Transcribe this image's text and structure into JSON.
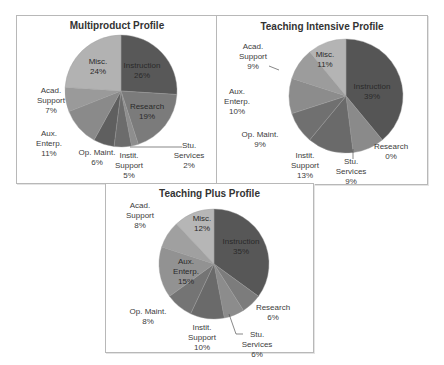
{
  "chart_data": [
    {
      "type": "pie",
      "title": "Multiproduct Profile",
      "frame": {
        "x": 16,
        "y": 15,
        "w": 200,
        "h": 167
      },
      "pie": {
        "cx": 104,
        "cy": 75,
        "r": 56
      },
      "slices": [
        {
          "name": "Instruction",
          "value": 26,
          "color": "#585858",
          "label": [
            "Instruction",
            "26%"
          ],
          "lx": 125,
          "ly": 52,
          "inside": true
        },
        {
          "name": "Research",
          "value": 19,
          "color": "#7b7b7b",
          "label": [
            "Research",
            "19%"
          ],
          "lx": 130,
          "ly": 93,
          "inside": true
        },
        {
          "name": "Stu. Services",
          "value": 2,
          "color": "#8e8e8e",
          "label": [
            "Stu.",
            "Services",
            "2%"
          ],
          "lx": 172,
          "ly": 132,
          "line": [
            [
              113,
              131
            ],
            [
              165,
              131
            ]
          ]
        },
        {
          "name": "Instit. Support",
          "value": 5,
          "color": "#6c6c6c",
          "label": [
            "Instit.",
            "Support",
            "5%"
          ],
          "lx": 112,
          "ly": 142
        },
        {
          "name": "Op. Maint.",
          "value": 6,
          "color": "#5f5f5f",
          "label": [
            "Op. Maint.",
            "6%"
          ],
          "lx": 80,
          "ly": 139
        },
        {
          "name": "Aux. Enterp.",
          "value": 11,
          "color": "#8a8a8a",
          "label": [
            "Aux.",
            "Enterp.",
            "11%"
          ],
          "lx": 32,
          "ly": 120
        },
        {
          "name": "Acad. Support",
          "value": 7,
          "color": "#9a9a9a",
          "label": [
            "Acad.",
            "Support",
            "7%"
          ],
          "lx": 34,
          "ly": 77
        },
        {
          "name": "Misc.",
          "value": 24,
          "color": "#b2b2b2",
          "label": [
            "Misc.",
            "24%"
          ],
          "lx": 81,
          "ly": 48,
          "inside": true
        }
      ]
    },
    {
      "type": "pie",
      "title": "Teaching Intensive Profile",
      "frame": {
        "x": 216,
        "y": 15,
        "w": 210,
        "h": 168
      },
      "pie": {
        "cx": 129,
        "cy": 80,
        "r": 57
      },
      "slices": [
        {
          "name": "Instruction",
          "value": 39,
          "color": "#555555",
          "label": [
            "Instruction",
            "39%"
          ],
          "lx": 155,
          "ly": 73,
          "inside": true
        },
        {
          "name": "Research",
          "value": 0,
          "color": "#7b7b7b",
          "label": [
            "Research",
            "0%"
          ],
          "lx": 174,
          "ly": 133
        },
        {
          "name": "Stu. Services",
          "value": 9,
          "color": "#8a8a8a",
          "label": [
            "Stu.",
            "Services",
            "9%"
          ],
          "lx": 134,
          "ly": 148,
          "line": [
            [
              136,
              133
            ],
            [
              136,
              143
            ]
          ]
        },
        {
          "name": "Instit. Support",
          "value": 13,
          "color": "#6a6a6a",
          "label": [
            "Instit.",
            "Support",
            "13%"
          ],
          "lx": 88,
          "ly": 142
        },
        {
          "name": "Op. Maint.",
          "value": 9,
          "color": "#707070",
          "label": [
            "Op. Maint.",
            "9%"
          ],
          "lx": 43,
          "ly": 121
        },
        {
          "name": "Aux. Enterp.",
          "value": 10,
          "color": "#8c8c8c",
          "label": [
            "Aux.",
            "Enterp.",
            "10%"
          ],
          "lx": 20,
          "ly": 78
        },
        {
          "name": "Acad. Support",
          "value": 9,
          "color": "#9c9c9c",
          "label": [
            "Acad.",
            "Support",
            "9%"
          ],
          "lx": 36,
          "ly": 33,
          "line": [
            [
              52,
              50
            ],
            [
              62,
              54
            ]
          ]
        },
        {
          "name": "Misc.",
          "value": 11,
          "color": "#b4b4b4",
          "label": [
            "Misc.",
            "11%"
          ],
          "lx": 108,
          "ly": 41,
          "inside": true
        }
      ]
    },
    {
      "type": "pie",
      "title": "Teaching Plus Profile",
      "frame": {
        "x": 105,
        "y": 183,
        "w": 207,
        "h": 168
      },
      "pie": {
        "cx": 108,
        "cy": 80,
        "r": 55
      },
      "slices": [
        {
          "name": "Instruction",
          "value": 35,
          "color": "#575757",
          "label": [
            "Instruction",
            "35%"
          ],
          "lx": 135,
          "ly": 60,
          "inside": true
        },
        {
          "name": "Research",
          "value": 6,
          "color": "#7c7c7c",
          "label": [
            "Research",
            "6%"
          ],
          "lx": 167,
          "ly": 126
        },
        {
          "name": "Stu. Services",
          "value": 6,
          "color": "#8c8c8c",
          "label": [
            "Stu.",
            "Services",
            "6%"
          ],
          "lx": 151,
          "ly": 153,
          "line": [
            [
              123,
              130
            ],
            [
              130,
              150
            ],
            [
              137,
              150
            ]
          ]
        },
        {
          "name": "Instit. Support",
          "value": 10,
          "color": "#6a6a6a",
          "label": [
            "Instit.",
            "Support",
            "10%"
          ],
          "lx": 96,
          "ly": 146
        },
        {
          "name": "Op. Maint.",
          "value": 8,
          "color": "#747474",
          "label": [
            "Op. Maint.",
            "8%"
          ],
          "lx": 42,
          "ly": 130
        },
        {
          "name": "Aux. Enterp.",
          "value": 15,
          "color": "#929292",
          "label": [
            "Aux.",
            "Enterp.",
            "15%"
          ],
          "lx": 80,
          "ly": 80,
          "inside": true
        },
        {
          "name": "Acad. Support",
          "value": 8,
          "color": "#a0a0a0",
          "label": [
            "Acad.",
            "Support",
            "8%"
          ],
          "lx": 34,
          "ly": 24
        },
        {
          "name": "Misc.",
          "value": 12,
          "color": "#b6b6b6",
          "label": [
            "Misc.",
            "12%"
          ],
          "lx": 96,
          "ly": 37,
          "inside": true
        }
      ]
    }
  ]
}
